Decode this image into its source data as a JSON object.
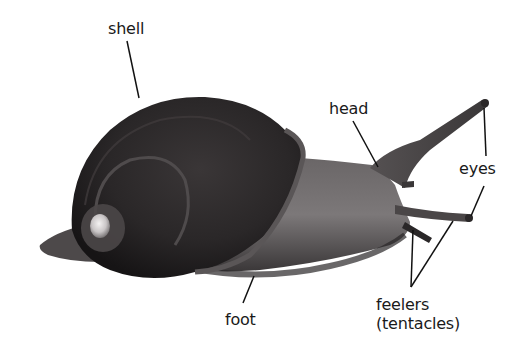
{
  "diagram": {
    "labels": {
      "shell": "shell",
      "head": "head",
      "eyes": "eyes",
      "foot": "foot",
      "feelers_line1": "feelers",
      "feelers_line2": "(tentacles)"
    }
  },
  "colors": {
    "background": "#ffffff",
    "text": "#1a1a1a",
    "leader_line": "#111111",
    "shell_dark": "#1e1c1d",
    "shell_mid": "#4a4648",
    "body_mid": "#5d5a5b",
    "body_light": "#8a8687"
  }
}
